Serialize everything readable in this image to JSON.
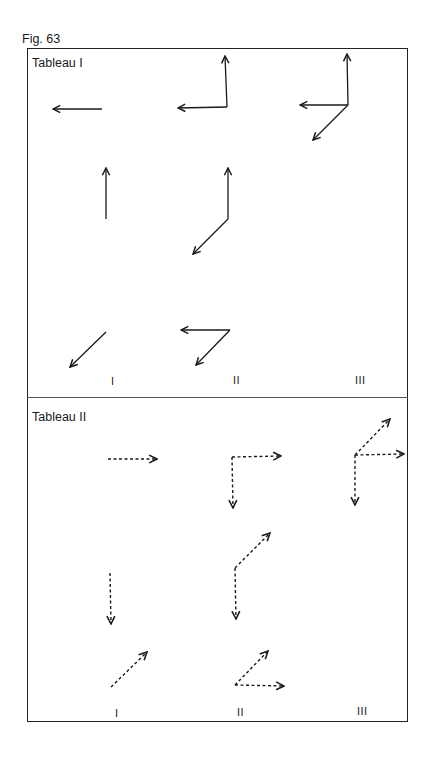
{
  "figure": {
    "label": "Fig. 63"
  },
  "tableau1": {
    "title": "Tableau I",
    "columns": [
      "I",
      "II",
      "III"
    ],
    "line_style": "solid"
  },
  "tableau2": {
    "title": "Tableau II",
    "columns": [
      "I",
      "II",
      "III"
    ],
    "line_style": "dashed"
  },
  "colors": {
    "ink": "#1a1a1a",
    "frame": "#222222",
    "divider": "#555555"
  }
}
